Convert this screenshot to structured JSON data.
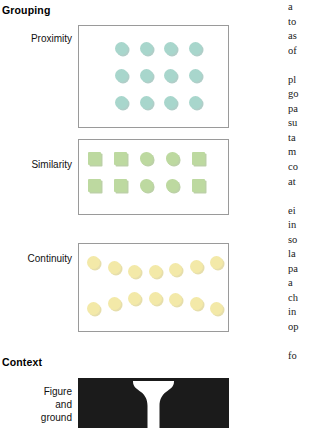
{
  "figure": {
    "sections": [
      {
        "id": "grouping",
        "heading": "Grouping"
      },
      {
        "id": "context",
        "heading": "Context"
      }
    ],
    "rows": [
      {
        "id": "proximity",
        "label": "Proximity"
      },
      {
        "id": "similarity",
        "label": "Similarity"
      },
      {
        "id": "continuity",
        "label": "Continuity"
      },
      {
        "id": "figure-ground",
        "label_line1": "Figure",
        "label_line2": "and",
        "label_line3": "ground"
      }
    ],
    "panels": {
      "proximity": {
        "shape": "circle",
        "color": "#a8d6cc",
        "columns": 4,
        "rows": 3,
        "count": 12
      },
      "similarity": {
        "color": "#bdd9a0",
        "columns": 5,
        "rows": 2,
        "count": 10,
        "pattern": [
          "square",
          "square",
          "circle",
          "circle",
          "square"
        ]
      },
      "continuity": {
        "shape": "circle",
        "color": "#f3e9a8",
        "rows": 2,
        "per_row": 7,
        "count": 14,
        "arrangement": "two-crossing-curved-rows"
      },
      "figure_ground": {
        "background_color": "#1b1b1b",
        "figure_color": "#ffffff",
        "motif": "rubin-vase-two-faces"
      }
    }
  },
  "text_column": {
    "block1": [
      "a",
      "to",
      "as",
      "of"
    ],
    "block2": [
      "pl",
      "go",
      "pa",
      "su",
      "ta",
      "m",
      "co",
      "at"
    ],
    "block3": [
      "ei",
      "in",
      "so",
      "la",
      "pa",
      "a",
      "ch",
      "in",
      "op"
    ],
    "block4": [
      "fo"
    ]
  }
}
